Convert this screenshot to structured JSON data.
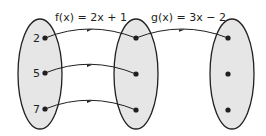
{
  "diagram": {
    "type": "function-composition-mapping",
    "functions": [
      {
        "name": "f",
        "label": "f(x) = 2x + 1"
      },
      {
        "name": "g",
        "label": "g(x) = 3x − 2"
      }
    ],
    "sets": [
      {
        "name": "domain",
        "elements": [
          "2",
          "5",
          "7"
        ]
      },
      {
        "name": "intermediate",
        "elements": [
          "",
          "",
          ""
        ]
      },
      {
        "name": "range",
        "elements": [
          "",
          "",
          ""
        ]
      }
    ],
    "arrows": [
      {
        "from": "set0-el0",
        "to": "set1-el0",
        "via": "f"
      },
      {
        "from": "set0-el1",
        "to": "set1-el1",
        "via": "f"
      },
      {
        "from": "set0-el2",
        "to": "set1-el2",
        "via": "f"
      },
      {
        "from": "set1-el0",
        "to": "set2-el0",
        "via": "g"
      }
    ],
    "colors": {
      "ellipse_fill": "#e6e6e6",
      "stroke": "#231f20"
    }
  }
}
